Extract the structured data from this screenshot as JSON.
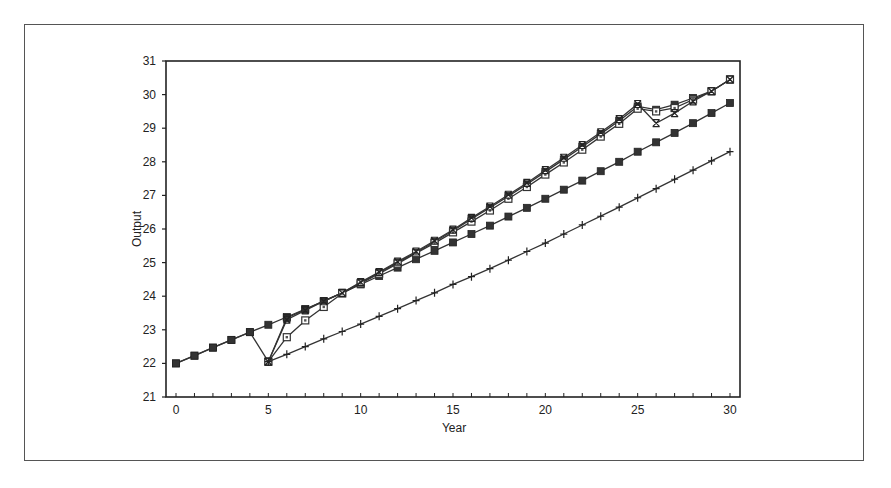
{
  "chart_data": {
    "type": "line",
    "title": "",
    "xlabel": "Year",
    "ylabel": "Output",
    "xlim": [
      0,
      30
    ],
    "ylim": [
      21,
      31
    ],
    "xticks": [
      0,
      5,
      10,
      15,
      20,
      25,
      30
    ],
    "yticks": [
      21,
      22,
      23,
      24,
      25,
      26,
      27,
      28,
      29,
      30,
      31
    ],
    "grid": false,
    "legend": null,
    "series": [
      {
        "name": "Baseline (filled square)",
        "marker": "filled-square",
        "x": [
          0,
          1,
          2,
          3,
          4,
          5,
          6,
          7,
          8,
          9,
          10,
          11,
          12,
          13,
          14,
          15,
          16,
          17,
          18,
          19,
          20,
          21,
          22,
          23,
          24,
          25,
          26,
          27,
          28,
          29,
          30
        ],
        "values": [
          22.0,
          22.23,
          22.47,
          22.7,
          22.93,
          23.15,
          23.38,
          23.62,
          23.85,
          24.1,
          24.35,
          24.6,
          24.85,
          25.1,
          25.35,
          25.6,
          25.85,
          26.1,
          26.37,
          26.63,
          26.9,
          27.17,
          27.44,
          27.72,
          28.0,
          28.3,
          28.58,
          28.86,
          29.15,
          29.45,
          29.75
        ]
      },
      {
        "name": "Shock path A (filled square)",
        "marker": "filled-square",
        "x": [
          0,
          1,
          2,
          3,
          4,
          5,
          6,
          7,
          8,
          9,
          10,
          11,
          12,
          13,
          14,
          15,
          16,
          17,
          18,
          19,
          20,
          21,
          22,
          23,
          24,
          25,
          26,
          27,
          28,
          29,
          30
        ],
        "values": [
          22.0,
          22.23,
          22.47,
          22.7,
          22.93,
          22.05,
          23.35,
          23.6,
          23.85,
          24.1,
          24.4,
          24.7,
          25.0,
          25.3,
          25.62,
          25.95,
          26.3,
          26.63,
          26.98,
          27.33,
          27.7,
          28.07,
          28.45,
          28.83,
          29.22,
          29.65,
          29.55,
          29.7,
          29.9,
          30.1,
          30.45
        ]
      },
      {
        "name": "Shock path B (open square)",
        "marker": "open-square",
        "x": [
          5,
          6,
          7,
          8,
          9,
          10,
          11,
          12,
          13,
          14,
          15,
          16,
          17,
          18,
          19,
          20,
          21,
          22,
          23,
          24,
          25,
          26,
          27,
          28,
          29,
          30
        ],
        "values": [
          22.05,
          22.78,
          23.28,
          23.68,
          24.08,
          24.38,
          24.67,
          24.97,
          25.28,
          25.58,
          25.9,
          26.22,
          26.55,
          26.9,
          27.25,
          27.62,
          27.98,
          28.36,
          28.75,
          29.13,
          29.58,
          29.5,
          29.6,
          29.85,
          30.1,
          30.45
        ]
      },
      {
        "name": "Shock path C (cross)",
        "marker": "x",
        "x": [
          5,
          6,
          7,
          8,
          9,
          10,
          11,
          12,
          13,
          14,
          15,
          16,
          17,
          18,
          19,
          20,
          21,
          22,
          23,
          24,
          25,
          26,
          27,
          28,
          29,
          30
        ],
        "values": [
          22.05,
          23.3,
          23.58,
          23.85,
          24.1,
          24.42,
          24.72,
          25.03,
          25.33,
          25.65,
          25.98,
          26.33,
          26.67,
          27.02,
          27.37,
          27.75,
          28.12,
          28.5,
          28.88,
          29.27,
          29.72,
          29.15,
          29.45,
          29.8,
          30.1,
          30.45
        ]
      },
      {
        "name": "Low path (plus)",
        "marker": "plus",
        "x": [
          5,
          6,
          7,
          8,
          9,
          10,
          11,
          12,
          13,
          14,
          15,
          16,
          17,
          18,
          19,
          20,
          21,
          22,
          23,
          24,
          25,
          26,
          27,
          28,
          29,
          30
        ],
        "values": [
          22.05,
          22.27,
          22.5,
          22.73,
          22.95,
          23.17,
          23.4,
          23.63,
          23.87,
          24.1,
          24.35,
          24.58,
          24.82,
          25.07,
          25.33,
          25.58,
          25.85,
          26.12,
          26.38,
          26.65,
          26.93,
          27.2,
          27.48,
          27.75,
          28.03,
          28.3
        ]
      }
    ]
  },
  "axes": {
    "x_title": "Year",
    "y_title": "Output"
  }
}
